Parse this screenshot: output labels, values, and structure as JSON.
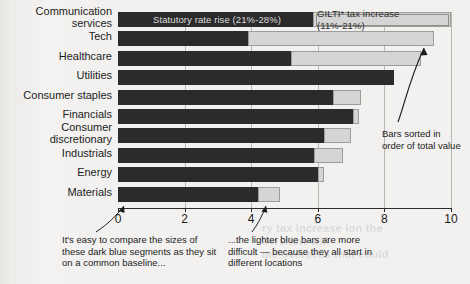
{
  "chart_data": {
    "type": "bar",
    "orientation": "horizontal",
    "stacked": true,
    "title": "",
    "xlabel": "",
    "ylabel": "",
    "xlim": [
      0,
      10
    ],
    "xticks": [
      "0",
      "2",
      "4",
      "6",
      "8",
      "10"
    ],
    "grid": true,
    "legend_position": "inside-top",
    "categories": [
      "Communication services",
      "Tech",
      "Healthcare",
      "Utilities",
      "Consumer staples",
      "Financials",
      "Consumer discretionary",
      "Industrials",
      "Energy",
      "Materials"
    ],
    "series": [
      {
        "name": "Statutory rate rise (21%-28%)",
        "color": "#2b2b2b",
        "values": [
          5.85,
          3.9,
          5.2,
          8.3,
          6.45,
          7.05,
          6.2,
          5.9,
          6.0,
          4.2
        ]
      },
      {
        "name": "GILTI* tax increase (11%-21%)",
        "color": "#d5d5d5",
        "values": [
          4.15,
          5.6,
          3.9,
          0.0,
          0.85,
          0.2,
          0.8,
          0.85,
          0.2,
          0.65
        ]
      }
    ],
    "totals": [
      10.0,
      9.5,
      9.1,
      8.3,
      7.3,
      7.25,
      7.0,
      6.75,
      6.2,
      4.85
    ],
    "legend": [
      "Statutory rate rise (21%-28%)",
      "GILTI* tax increase (11%-21%)"
    ],
    "annotations": [
      "Bars sorted in order of total value",
      "It's easy to compare the sizes of these dark blue segments as they sit on a common baseline...",
      "...the lighter blue bars are more difficult — because they all start in different locations"
    ]
  },
  "legend": {
    "statutory": "Statutory rate rise (21%-28%)",
    "gilti": "GILTI* tax increase (11%-21%)"
  },
  "annotations": {
    "sorted": "Bars sorted in order of total value",
    "left_caption": "It's easy to compare the sizes of these dark blue segments as they sit on a common baseline...",
    "right_caption": "...the lighter blue bars are more difficult — because they all start in different locations"
  },
  "ghost": {
    "line1": "ry tax increase ion the",
    "line2": "llers/low will",
    "line3": "me overseas that could"
  }
}
